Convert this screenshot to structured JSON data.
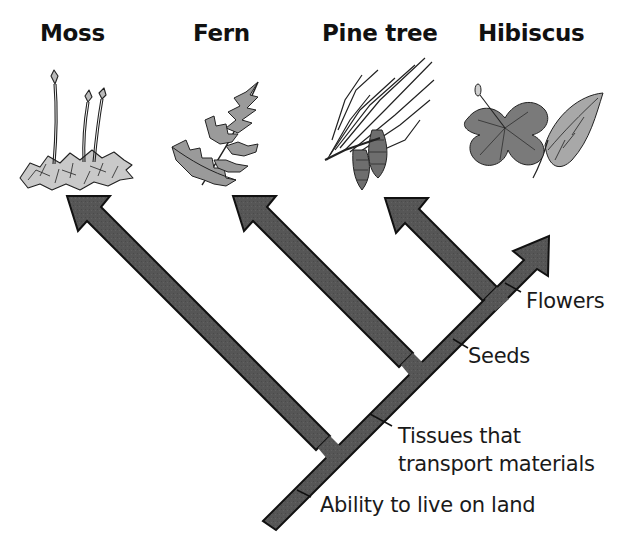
{
  "diagram": {
    "type": "cladogram",
    "colors": {
      "branch_fill": "#555555",
      "branch_stroke": "#111111",
      "plant_light": "#bdbdbd",
      "plant_mid": "#8a8a8a",
      "plant_dark": "#5a5a5a",
      "background": "#ffffff"
    },
    "taxa": [
      {
        "id": "moss",
        "label": "Moss",
        "icon": "moss-illustration"
      },
      {
        "id": "fern",
        "label": "Fern",
        "icon": "fern-illustration"
      },
      {
        "id": "pine",
        "label": "Pine tree",
        "icon": "pine-branch-illustration"
      },
      {
        "id": "hibiscus",
        "label": "Hibiscus",
        "icon": "hibiscus-flower-illustration"
      }
    ],
    "traits": [
      {
        "id": "land",
        "label": "Ability to live on land"
      },
      {
        "id": "tissues",
        "line1": "Tissues that",
        "line2": "transport materials"
      },
      {
        "id": "seeds",
        "label": "Seeds"
      },
      {
        "id": "flowers",
        "label": "Flowers"
      }
    ]
  }
}
